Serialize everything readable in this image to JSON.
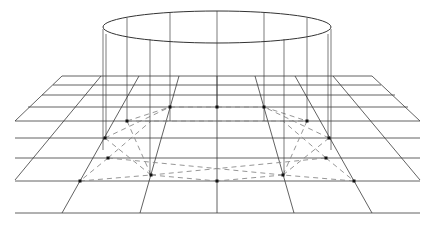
{
  "diagram": {
    "title": "",
    "colors": {
      "background": "#ffffff",
      "grid": "#3a3a3a",
      "cylinder": "#444444",
      "construction_dashed": "#8a8a8a",
      "points": "#111111"
    },
    "ellipse": {
      "cx": 217,
      "cy": 27,
      "rx": 114,
      "ry": 16
    },
    "horizontal_lines": [
      {
        "y": 76,
        "x1": 62,
        "x2": 372
      },
      {
        "y": 85,
        "x1": 53,
        "x2": 381
      },
      {
        "y": 95,
        "x1": 42,
        "x2": 395
      },
      {
        "y": 107,
        "x1": 28,
        "x2": 408
      },
      {
        "y": 121,
        "x1": 15,
        "x2": 420
      },
      {
        "y": 138,
        "x1": 15,
        "x2": 420
      },
      {
        "y": 158,
        "x1": 15,
        "x2": 420
      },
      {
        "y": 181,
        "x1": 15,
        "x2": 420
      },
      {
        "y": 213,
        "x1": 15,
        "x2": 420
      }
    ],
    "converging_lines": [
      {
        "x1": 62,
        "y1": 76,
        "x2": 15,
        "y2": 121
      },
      {
        "x1": 101,
        "y1": 76,
        "x2": 15,
        "y2": 180
      },
      {
        "x1": 139,
        "y1": 76,
        "x2": 62,
        "y2": 213
      },
      {
        "x1": 179,
        "y1": 76,
        "x2": 140,
        "y2": 213
      },
      {
        "x1": 217,
        "y1": 76,
        "x2": 217,
        "y2": 213
      },
      {
        "x1": 255,
        "y1": 76,
        "x2": 294,
        "y2": 213
      },
      {
        "x1": 295,
        "y1": 76,
        "x2": 372,
        "y2": 213
      },
      {
        "x1": 333,
        "y1": 76,
        "x2": 420,
        "y2": 180
      },
      {
        "x1": 372,
        "y1": 76,
        "x2": 420,
        "y2": 121
      }
    ],
    "cylinder_verticals": [
      {
        "x": 103,
        "y1": 29,
        "y2": 150
      },
      {
        "x": 106,
        "y1": 34,
        "y2": 138
      },
      {
        "x": 127,
        "y1": 18,
        "y2": 121
      },
      {
        "x": 150,
        "y1": 39,
        "y2": 175
      },
      {
        "x": 170,
        "y1": 13,
        "y2": 121
      },
      {
        "x": 217,
        "y1": 11,
        "y2": 107
      },
      {
        "x": 264,
        "y1": 13,
        "y2": 121
      },
      {
        "x": 284,
        "y1": 39,
        "y2": 175
      },
      {
        "x": 307,
        "y1": 18,
        "y2": 121
      },
      {
        "x": 328,
        "y1": 34,
        "y2": 138
      },
      {
        "x": 331,
        "y1": 29,
        "y2": 150
      }
    ],
    "points": [
      {
        "x": 127,
        "y": 121
      },
      {
        "x": 170,
        "y": 107
      },
      {
        "x": 217,
        "y": 107
      },
      {
        "x": 264,
        "y": 107
      },
      {
        "x": 307,
        "y": 121
      },
      {
        "x": 105,
        "y": 138
      },
      {
        "x": 329,
        "y": 138
      },
      {
        "x": 108,
        "y": 158
      },
      {
        "x": 326,
        "y": 158
      },
      {
        "x": 151,
        "y": 175
      },
      {
        "x": 283,
        "y": 175
      },
      {
        "x": 80,
        "y": 181
      },
      {
        "x": 354,
        "y": 181
      },
      {
        "x": 217,
        "y": 181
      }
    ],
    "dashed_segments": [
      {
        "x1": 127,
        "y1": 121,
        "x2": 170,
        "y2": 107
      },
      {
        "x1": 170,
        "y1": 107,
        "x2": 217,
        "y2": 107
      },
      {
        "x1": 217,
        "y1": 107,
        "x2": 264,
        "y2": 107
      },
      {
        "x1": 264,
        "y1": 107,
        "x2": 307,
        "y2": 121
      },
      {
        "x1": 127,
        "y1": 121,
        "x2": 307,
        "y2": 121
      },
      {
        "x1": 105,
        "y1": 138,
        "x2": 170,
        "y2": 107
      },
      {
        "x1": 329,
        "y1": 138,
        "x2": 264,
        "y2": 107
      },
      {
        "x1": 127,
        "y1": 121,
        "x2": 151,
        "y2": 175
      },
      {
        "x1": 307,
        "y1": 121,
        "x2": 283,
        "y2": 175
      },
      {
        "x1": 108,
        "y1": 158,
        "x2": 151,
        "y2": 121
      },
      {
        "x1": 326,
        "y1": 158,
        "x2": 283,
        "y2": 121
      },
      {
        "x1": 108,
        "y1": 158,
        "x2": 80,
        "y2": 181
      },
      {
        "x1": 326,
        "y1": 158,
        "x2": 354,
        "y2": 181
      },
      {
        "x1": 108,
        "y1": 158,
        "x2": 283,
        "y2": 175
      },
      {
        "x1": 326,
        "y1": 158,
        "x2": 151,
        "y2": 175
      },
      {
        "x1": 80,
        "y1": 181,
        "x2": 151,
        "y2": 175
      },
      {
        "x1": 354,
        "y1": 181,
        "x2": 283,
        "y2": 175
      },
      {
        "x1": 151,
        "y1": 175,
        "x2": 217,
        "y2": 181
      },
      {
        "x1": 283,
        "y1": 175,
        "x2": 217,
        "y2": 181
      },
      {
        "x1": 151,
        "y1": 175,
        "x2": 105,
        "y2": 138
      },
      {
        "x1": 283,
        "y1": 175,
        "x2": 329,
        "y2": 138
      }
    ]
  }
}
